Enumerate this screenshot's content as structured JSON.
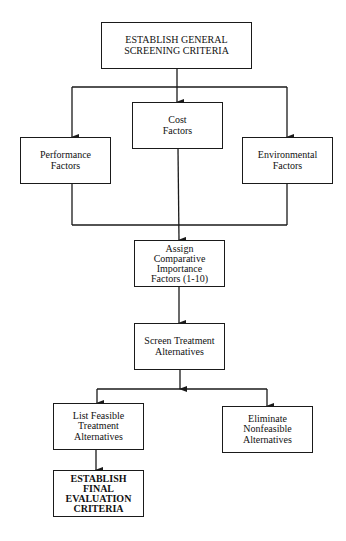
{
  "diagram": {
    "type": "flowchart",
    "nodes": [
      {
        "id": "general_criteria",
        "label": "ESTABLISH GENERAL\nSCREENING CRITERIA"
      },
      {
        "id": "cost_factors",
        "label": "Cost\nFactors"
      },
      {
        "id": "performance_factors",
        "label": "Performance\nFactors"
      },
      {
        "id": "environmental_factors",
        "label": "Environmental\nFactors"
      },
      {
        "id": "assign_importance",
        "label": "Assign\nComparative\nImportance\nFactors (1-10)"
      },
      {
        "id": "screen_alternatives",
        "label": "Screen Treatment\nAlternatives"
      },
      {
        "id": "list_feasible",
        "label": "List Feasible\nTreatment\nAlternatives"
      },
      {
        "id": "eliminate_nonfeasible",
        "label": "Eliminate\nNonfeasible\nAlternatives"
      },
      {
        "id": "final_criteria",
        "label": "ESTABLISH\nFINAL\nEVALUATION\nCRITERIA"
      }
    ],
    "edges": [
      {
        "from": "general_criteria",
        "to": "performance_factors"
      },
      {
        "from": "general_criteria",
        "to": "cost_factors"
      },
      {
        "from": "general_criteria",
        "to": "environmental_factors"
      },
      {
        "from": "performance_factors",
        "to": "assign_importance"
      },
      {
        "from": "cost_factors",
        "to": "assign_importance"
      },
      {
        "from": "environmental_factors",
        "to": "assign_importance"
      },
      {
        "from": "assign_importance",
        "to": "screen_alternatives"
      },
      {
        "from": "screen_alternatives",
        "to": "list_feasible"
      },
      {
        "from": "screen_alternatives",
        "to": "eliminate_nonfeasible"
      },
      {
        "from": "list_feasible",
        "to": "final_criteria"
      }
    ]
  },
  "labels": {
    "general_criteria": "ESTABLISH GENERAL\nSCREENING CRITERIA",
    "cost_factors": "Cost\nFactors",
    "performance_factors": "Performance\nFactors",
    "environmental_factors": "Environmental\nFactors",
    "assign_importance": "Assign\nComparative\nImportance\nFactors (1-10)",
    "screen_alternatives": "Screen Treatment\nAlternatives",
    "list_feasible": "List Feasible\nTreatment\nAlternatives",
    "eliminate_nonfeasible": "Eliminate\nNonfeasible\nAlternatives",
    "final_criteria": "ESTABLISH\nFINAL\nEVALUATION\nCRITERIA"
  },
  "colors": {
    "line": "#1a1a1a",
    "background": "#ffffff"
  }
}
